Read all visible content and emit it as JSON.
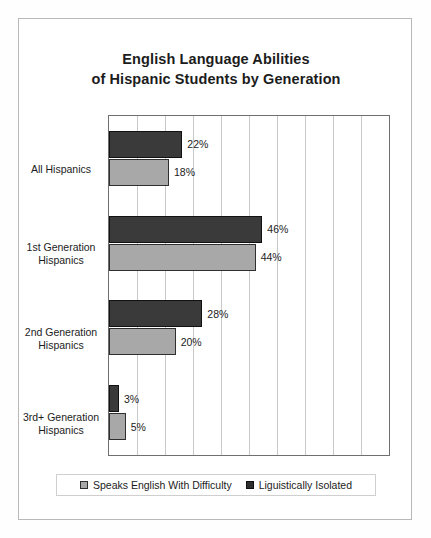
{
  "chart_data": {
    "type": "bar",
    "orientation": "horizontal",
    "title": "English Language Abilities of Hispanic Students by Generation",
    "title_line1": "English Language Abilities",
    "title_line2": "of Hispanic Students by Generation",
    "xlabel": "",
    "ylabel": "",
    "xlim": [
      0,
      84
    ],
    "grid": true,
    "grid_axis": "x",
    "grid_step": 8.4,
    "legend_position": "bottom",
    "categories": [
      "All Hispanics",
      "1st Generation Hispanics",
      "2nd Generation Hispanics",
      "3rd+ Generation Hispanics"
    ],
    "category_lines": [
      [
        "All Hispanics"
      ],
      [
        "1st Generation",
        "Hispanics"
      ],
      [
        "2nd Generation",
        "Hispanics"
      ],
      [
        "3rd+ Generation",
        "Hispanics"
      ]
    ],
    "series": [
      {
        "name": "Liguistically Isolated",
        "color": "#3a3a3a",
        "values": [
          22,
          46,
          28,
          3
        ],
        "labels": [
          "22%",
          "46%",
          "28%",
          "3%"
        ]
      },
      {
        "name": "Speaks English With Difficulty",
        "color": "#a8a8a8",
        "values": [
          18,
          44,
          20,
          5
        ],
        "labels": [
          "18%",
          "44%",
          "20%",
          "5%"
        ]
      }
    ],
    "legend_entries": [
      {
        "label": "Speaks English With Difficulty",
        "color": "#a8a8a8",
        "swatch": "light"
      },
      {
        "label": "Liguistically Isolated",
        "color": "#3a3a3a",
        "swatch": "dark"
      }
    ],
    "value_unit": "%",
    "note": "Within each category the dark bar is drawn above the light gray bar."
  },
  "colors": {
    "dark_series": "#3a3a3a",
    "light_series": "#a8a8a8",
    "plot_border": "#6f6f6f",
    "gridline": "#c9c9c9",
    "frame": "#b9b9b9",
    "text": "#1c1c1c",
    "background": "#ffffff"
  }
}
